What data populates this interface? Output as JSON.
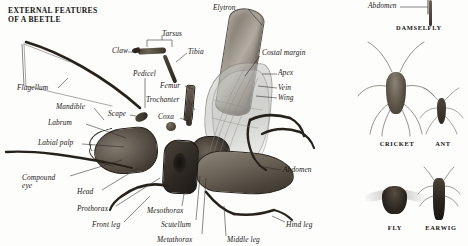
{
  "page": {
    "title": "EXTERNAL FEATURES\nOF A BEETLE",
    "background_color": "#fdfdfc",
    "text_color": "#1a1714",
    "leader_line_color": "#2b2724"
  },
  "beetle_labels": [
    {
      "id": "elytron",
      "text": "Elytron",
      "x": 213,
      "y": 4,
      "align": "left"
    },
    {
      "id": "tarsus",
      "text": "Tarsus",
      "x": 162,
      "y": 30,
      "align": "left"
    },
    {
      "id": "claw",
      "text": "Claw",
      "x": 112,
      "y": 47,
      "align": "left"
    },
    {
      "id": "tibia",
      "text": "Tibia",
      "x": 188,
      "y": 48,
      "align": "left"
    },
    {
      "id": "pedicel",
      "text": "Pedicel",
      "x": 133,
      "y": 70,
      "align": "left"
    },
    {
      "id": "costal-margin",
      "text": "Costal margin",
      "x": 262,
      "y": 49,
      "align": "left"
    },
    {
      "id": "femur",
      "text": "Femur",
      "x": 160,
      "y": 82,
      "align": "left"
    },
    {
      "id": "apex",
      "text": "Apex",
      "x": 278,
      "y": 69,
      "align": "left"
    },
    {
      "id": "vein",
      "text": "Vein",
      "x": 278,
      "y": 84,
      "align": "left"
    },
    {
      "id": "wing",
      "text": "Wing",
      "x": 278,
      "y": 94,
      "align": "left"
    },
    {
      "id": "trochanter",
      "text": "Trochanter",
      "x": 146,
      "y": 96,
      "align": "left"
    },
    {
      "id": "flagellum",
      "text": "Flagellum",
      "x": 17,
      "y": 84,
      "align": "left"
    },
    {
      "id": "mandible",
      "text": "Mandible",
      "x": 56,
      "y": 103,
      "align": "left"
    },
    {
      "id": "scape",
      "text": "Scape",
      "x": 108,
      "y": 110,
      "align": "left"
    },
    {
      "id": "coxa",
      "text": "Coxa",
      "x": 158,
      "y": 113,
      "align": "left"
    },
    {
      "id": "labrum",
      "text": "Labrum",
      "x": 48,
      "y": 119,
      "align": "left"
    },
    {
      "id": "labial-palp",
      "text": "Labial palp",
      "x": 38,
      "y": 139,
      "align": "left"
    },
    {
      "id": "abdomen-beetle",
      "text": "Abdomen",
      "x": 283,
      "y": 166,
      "align": "left"
    },
    {
      "id": "compound-eye",
      "text": "Compound\neye",
      "x": 22,
      "y": 174,
      "align": "left"
    },
    {
      "id": "head",
      "text": "Head",
      "x": 77,
      "y": 188,
      "align": "left"
    },
    {
      "id": "prothorax",
      "text": "Prothorax",
      "x": 77,
      "y": 205,
      "align": "left"
    },
    {
      "id": "mesothorax",
      "text": "Mesothorax",
      "x": 147,
      "y": 207,
      "align": "left"
    },
    {
      "id": "front-leg",
      "text": "Front leg",
      "x": 92,
      "y": 221,
      "align": "left"
    },
    {
      "id": "scutellum",
      "text": "Scutellum",
      "x": 161,
      "y": 221,
      "align": "left"
    },
    {
      "id": "hind-leg",
      "text": "Hind leg",
      "x": 286,
      "y": 221,
      "align": "left"
    },
    {
      "id": "metathorax",
      "text": "Metathorax",
      "x": 157,
      "y": 236,
      "align": "left"
    },
    {
      "id": "middle-leg",
      "text": "Middle leg",
      "x": 227,
      "y": 236,
      "align": "left"
    }
  ],
  "panel_labels": [
    {
      "id": "abdomen-damselfly",
      "text": "Abdomen",
      "x": 368,
      "y": 2,
      "align": "left"
    }
  ],
  "panel_captions": [
    {
      "id": "damselfly",
      "text": "DAMSELFLY",
      "x": 388,
      "y": 24,
      "w": 62
    },
    {
      "id": "cricket",
      "text": "CRICKET",
      "x": 366,
      "y": 140,
      "w": 62
    },
    {
      "id": "ant",
      "text": "ANT",
      "x": 424,
      "y": 140,
      "w": 38
    },
    {
      "id": "fly",
      "text": "FLY",
      "x": 376,
      "y": 224,
      "w": 38
    },
    {
      "id": "earwig",
      "text": "EARWIG",
      "x": 418,
      "y": 224,
      "w": 46
    }
  ],
  "leader_lines": [
    {
      "id": "elytron-leader",
      "x1": 248,
      "y1": 9,
      "x2": 262,
      "y2": 25
    },
    {
      "id": "tarsus-bracket-left",
      "x1": 147,
      "y1": 40,
      "x2": 147,
      "y2": 47
    },
    {
      "id": "tarsus-bracket-top",
      "x1": 147,
      "y1": 40,
      "x2": 172,
      "y2": 40
    },
    {
      "id": "tarsus-bracket-right",
      "x1": 172,
      "y1": 40,
      "x2": 172,
      "y2": 47
    },
    {
      "id": "tarsus-stem",
      "x1": 162,
      "y1": 40,
      "x2": 162,
      "y2": 35
    },
    {
      "id": "claw-leader",
      "x1": 128,
      "y1": 52,
      "x2": 137,
      "y2": 52
    },
    {
      "id": "tibia-leader",
      "x1": 187,
      "y1": 53,
      "x2": 176,
      "y2": 62
    },
    {
      "id": "costal-leader",
      "x1": 260,
      "y1": 56,
      "x2": 245,
      "y2": 76
    },
    {
      "id": "apex-leader",
      "x1": 277,
      "y1": 74,
      "x2": 262,
      "y2": 74
    },
    {
      "id": "vein-leader",
      "x1": 277,
      "y1": 88,
      "x2": 258,
      "y2": 86
    },
    {
      "id": "wing-leader",
      "x1": 277,
      "y1": 98,
      "x2": 256,
      "y2": 96
    },
    {
      "id": "pedicel-leader",
      "x1": 145,
      "y1": 78,
      "x2": 145,
      "y2": 108
    },
    {
      "id": "femur-leader",
      "x1": 185,
      "y1": 86,
      "x2": 193,
      "y2": 89
    },
    {
      "id": "trochanter-leader",
      "x1": 188,
      "y1": 100,
      "x2": 195,
      "y2": 110
    },
    {
      "id": "coxa-leader",
      "x1": 180,
      "y1": 118,
      "x2": 190,
      "y2": 122
    },
    {
      "id": "flagellum-bracket-a",
      "x1": 22,
      "y1": 44,
      "x2": 24,
      "y2": 86
    },
    {
      "id": "flagellum-leader",
      "x1": 58,
      "y1": 88,
      "x2": 68,
      "y2": 78
    },
    {
      "id": "mandible-leader",
      "x1": 94,
      "y1": 108,
      "x2": 104,
      "y2": 120
    },
    {
      "id": "scape-leader",
      "x1": 130,
      "y1": 115,
      "x2": 136,
      "y2": 116
    },
    {
      "id": "labrum-leader",
      "x1": 86,
      "y1": 124,
      "x2": 126,
      "y2": 138
    },
    {
      "id": "labialpalp-leader",
      "x1": 82,
      "y1": 144,
      "x2": 124,
      "y2": 147
    },
    {
      "id": "abdomen-leader",
      "x1": 281,
      "y1": 170,
      "x2": 258,
      "y2": 166
    },
    {
      "id": "compound-leader",
      "x1": 70,
      "y1": 176,
      "x2": 122,
      "y2": 160
    },
    {
      "id": "head-leader",
      "x1": 102,
      "y1": 190,
      "x2": 138,
      "y2": 168
    },
    {
      "id": "prothorax-leader",
      "x1": 116,
      "y1": 206,
      "x2": 160,
      "y2": 178
    },
    {
      "id": "frontleg-leader",
      "x1": 124,
      "y1": 222,
      "x2": 150,
      "y2": 196
    },
    {
      "id": "mesothorax-leader",
      "x1": 182,
      "y1": 206,
      "x2": 186,
      "y2": 182
    },
    {
      "id": "scutellum-leader",
      "x1": 196,
      "y1": 220,
      "x2": 200,
      "y2": 176
    },
    {
      "id": "metathorax-leader",
      "x1": 202,
      "y1": 234,
      "x2": 206,
      "y2": 178
    },
    {
      "id": "middleleg-leader",
      "x1": 226,
      "y1": 236,
      "x2": 224,
      "y2": 206
    },
    {
      "id": "hindleg-leader",
      "x1": 285,
      "y1": 222,
      "x2": 272,
      "y2": 216
    },
    {
      "id": "damsel-abdomen-leader",
      "x1": 400,
      "y1": 7,
      "x2": 428,
      "y2": 7
    }
  ]
}
